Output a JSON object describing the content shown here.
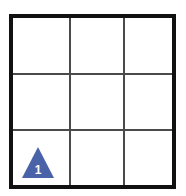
{
  "board": {
    "name": "grid-board",
    "rows": 3,
    "columns": 3,
    "outer_border_color": "#111111",
    "grid_line_color": "#4a4a4a",
    "background_color": "#ffffff",
    "cells": [
      {
        "id": "r1c1",
        "row": 1,
        "column": 1,
        "content": ""
      },
      {
        "id": "r1c2",
        "row": 1,
        "column": 2,
        "content": ""
      },
      {
        "id": "r1c3",
        "row": 1,
        "column": 3,
        "content": ""
      },
      {
        "id": "r2c1",
        "row": 2,
        "column": 1,
        "content": ""
      },
      {
        "id": "r2c2",
        "row": 2,
        "column": 2,
        "content": ""
      },
      {
        "id": "r2c3",
        "row": 2,
        "column": 3,
        "content": ""
      },
      {
        "id": "r3c1",
        "row": 3,
        "column": 1,
        "content": "triangle-marker-1"
      },
      {
        "id": "r3c2",
        "row": 3,
        "column": 2,
        "content": ""
      },
      {
        "id": "r3c3",
        "row": 3,
        "column": 3,
        "content": ""
      }
    ]
  },
  "markers": [
    {
      "icon": "triangle-up-icon",
      "label": "1",
      "fill_color": "#4a63a8",
      "label_color": "#ffffff",
      "row": 3,
      "column": 1
    }
  ]
}
